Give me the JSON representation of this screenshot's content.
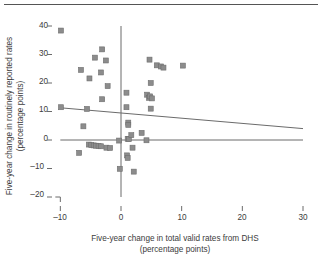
{
  "chart_data": {
    "type": "scatter",
    "title": "",
    "xlabel": "Five-year change in total valid rates from DHS (percentage points)",
    "ylabel": "Five-year change in routinely reported rates (percentage points)",
    "xlim": [
      -10,
      30
    ],
    "ylim": [
      -20,
      40
    ],
    "xticks": [
      -10,
      0,
      10,
      20,
      30
    ],
    "yticks": [
      -20,
      -10,
      0,
      10,
      20,
      30,
      40
    ],
    "grid": false,
    "legend": null,
    "reference_lines": [
      {
        "name": "zero-horizontal",
        "orientation": "horizontal",
        "value": 0
      },
      {
        "name": "zero-vertical",
        "orientation": "vertical",
        "value": 0
      }
    ],
    "trendline": {
      "name": "regression-line",
      "x": [
        -10,
        30
      ],
      "y": [
        11.3,
        4.0
      ],
      "slope": -0.18,
      "intercept": 9.5
    },
    "marker": {
      "shape": "square",
      "color": "#8c8c8c",
      "edge_color": "#6e6e6e",
      "size": 5
    },
    "points": [
      {
        "x": -9.9,
        "y": 38.4
      },
      {
        "x": -3.1,
        "y": 31.8
      },
      {
        "x": -4.3,
        "y": 28.9
      },
      {
        "x": -2.5,
        "y": 27.9
      },
      {
        "x": -6.6,
        "y": 24.6
      },
      {
        "x": -3.3,
        "y": 23.7
      },
      {
        "x": -5.2,
        "y": 21.6
      },
      {
        "x": -2.2,
        "y": 18.9
      },
      {
        "x": -3.1,
        "y": 14.3
      },
      {
        "x": -9.9,
        "y": 11.5
      },
      {
        "x": -5.6,
        "y": 10.9
      },
      {
        "x": -6.2,
        "y": 4.8
      },
      {
        "x": -5.3,
        "y": -1.6
      },
      {
        "x": -4.9,
        "y": -1.8
      },
      {
        "x": -4.5,
        "y": -1.9
      },
      {
        "x": -4.1,
        "y": -2.0
      },
      {
        "x": -3.7,
        "y": -2.1
      },
      {
        "x": -3.3,
        "y": -2.2
      },
      {
        "x": -2.4,
        "y": -2.7
      },
      {
        "x": -1.8,
        "y": -2.8
      },
      {
        "x": -6.9,
        "y": -4.5
      },
      {
        "x": -0.3,
        "y": -0.2
      },
      {
        "x": -0.2,
        "y": -10.1
      },
      {
        "x": 0.9,
        "y": 16.6
      },
      {
        "x": 0.9,
        "y": 11.5
      },
      {
        "x": 1.2,
        "y": 6.1
      },
      {
        "x": 1.2,
        "y": 5.3
      },
      {
        "x": 1.1,
        "y": 0.4
      },
      {
        "x": 1.3,
        "y": 0.3
      },
      {
        "x": 1.7,
        "y": 1.7
      },
      {
        "x": 1.0,
        "y": -5.4
      },
      {
        "x": 1.1,
        "y": -6.3
      },
      {
        "x": 2.1,
        "y": -11.1
      },
      {
        "x": 1.9,
        "y": -2.7
      },
      {
        "x": 3.4,
        "y": 2.5
      },
      {
        "x": 4.2,
        "y": -0.1
      },
      {
        "x": 4.3,
        "y": 15.9
      },
      {
        "x": 4.6,
        "y": 14.8
      },
      {
        "x": 4.8,
        "y": 15.3
      },
      {
        "x": 5.1,
        "y": 14.6
      },
      {
        "x": 4.9,
        "y": 20.0
      },
      {
        "x": 4.9,
        "y": 11.0
      },
      {
        "x": 4.7,
        "y": 28.2
      },
      {
        "x": 5.9,
        "y": 26.2
      },
      {
        "x": 6.6,
        "y": 25.8
      },
      {
        "x": 7.0,
        "y": 25.4
      },
      {
        "x": 10.2,
        "y": 26.1
      }
    ]
  },
  "labels": {
    "ylabel_line1": "Five-year change in routinely reported rates",
    "ylabel_line2": "(percentage points)",
    "xlabel_line1": "Five-year change in total valid rates from DHS",
    "xlabel_line2": "(percentage points)",
    "ytick_40": "40",
    "ytick_30": "30",
    "ytick_20": "20",
    "ytick_10": "10",
    "ytick_0": "0",
    "ytick_m10": "–10",
    "ytick_m20": "–20",
    "xtick_m10": "–10",
    "xtick_0": "0",
    "xtick_10": "10",
    "xtick_20": "20",
    "xtick_30": "30"
  },
  "colors": {
    "marker": "#8c8c8c",
    "line": "#6b6b6b",
    "text": "#3c3c3c",
    "rule": "#555555",
    "background": "#ffffff"
  }
}
